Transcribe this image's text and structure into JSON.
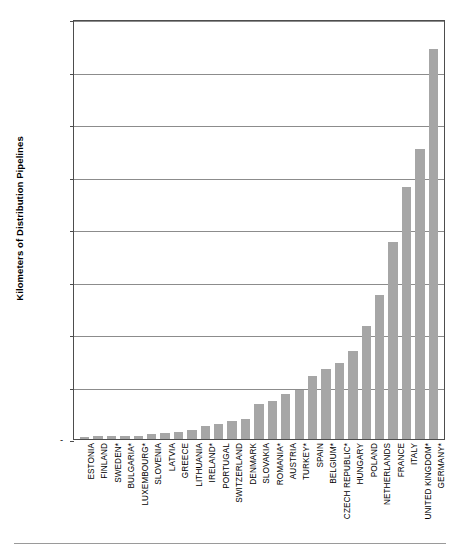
{
  "chart_data": {
    "type": "bar",
    "title": "",
    "xlabel": "",
    "ylabel": "Kilometers of Distribution Pipelines",
    "ylim": [
      0,
      400000
    ],
    "ytick_values": [
      0,
      50000,
      100000,
      150000,
      200000,
      250000,
      300000,
      350000,
      400000
    ],
    "ytick_labels": [
      "-",
      "50,000",
      "100,000",
      "150,000",
      "200,000",
      "250,000",
      "300,000",
      "350,000",
      "400,000"
    ],
    "grid": "horizontal",
    "legend": "none",
    "bar_color": "#a6a6a6",
    "categories": [
      "ESTONIA",
      "FINLAND",
      "SWEDEN*",
      "BULGARIA*",
      "LUXEMBOURG*",
      "SLOVENIA",
      "LATVIA",
      "GREECE",
      "LITHUANIA",
      "IRELAND*",
      "PORTUGAL",
      "SWITZERLAND",
      "DENMARK",
      "SLOVAKIA",
      "ROMANIA*",
      "AUSTRIA",
      "TURKEY*",
      "SPAIN",
      "BELGIUM*",
      "CZECH REPUBLIC*",
      "HUNGARY",
      "POLAND",
      "NETHERLANDS",
      "FRANCE",
      "ITALY",
      "UNITED KINGDOM*",
      "GERMANY*"
    ],
    "values": [
      2200,
      2700,
      3000,
      3200,
      3300,
      5000,
      5500,
      6500,
      9000,
      12000,
      14000,
      17500,
      19000,
      33000,
      36000,
      43000,
      47000,
      60000,
      67000,
      72000,
      84000,
      108000,
      137000,
      188000,
      240000,
      276000,
      371000
    ]
  },
  "axis": {
    "zero_dash": "-"
  }
}
